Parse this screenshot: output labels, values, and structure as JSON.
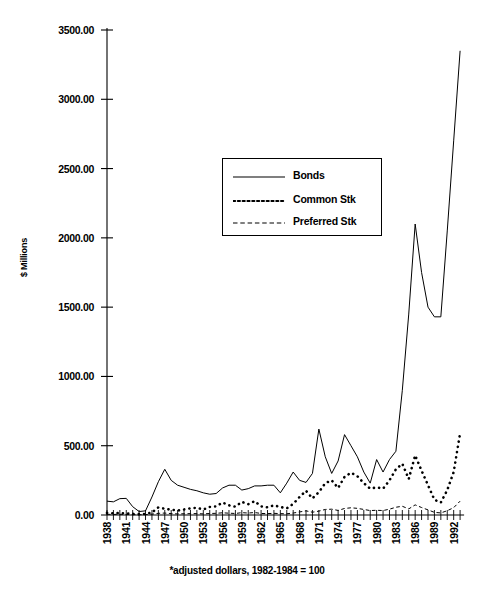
{
  "chart_data": {
    "type": "line",
    "title": "",
    "xlabel": "",
    "ylabel": "$ Millions",
    "footnote": "*adjusted dollars, 1982-1984 = 100",
    "ylim": [
      0,
      3500
    ],
    "ytick_labels": [
      "3500.00",
      "3000.00",
      "2500.00",
      "2000.00",
      "1500.00",
      "1000.00",
      "500.00",
      "0.00"
    ],
    "ytick_values": [
      3500,
      3000,
      2500,
      2000,
      1500,
      1000,
      500,
      0
    ],
    "xlim": [
      1938,
      1993
    ],
    "xtick_labels": [
      "1938",
      "1941",
      "1944",
      "1947",
      "1950",
      "1953",
      "1956",
      "1959",
      "1962",
      "1965",
      "1968",
      "1971",
      "1974",
      "1977",
      "1980",
      "1983",
      "1986",
      "1989",
      "1992"
    ],
    "x": [
      1938,
      1939,
      1940,
      1941,
      1942,
      1943,
      1944,
      1945,
      1946,
      1947,
      1948,
      1949,
      1950,
      1951,
      1952,
      1953,
      1954,
      1955,
      1956,
      1957,
      1958,
      1959,
      1960,
      1961,
      1962,
      1963,
      1964,
      1965,
      1966,
      1967,
      1968,
      1969,
      1970,
      1971,
      1972,
      1973,
      1974,
      1975,
      1976,
      1977,
      1978,
      1979,
      1980,
      1981,
      1982,
      1983,
      1984,
      1985,
      1986,
      1987,
      1988,
      1989,
      1990,
      1991,
      1992,
      1993
    ],
    "grid": false,
    "legend_position": "upper-center",
    "series": [
      {
        "name": "Bonds",
        "style": "solid",
        "color": "#000000",
        "values": [
          100,
          95,
          118,
          120,
          60,
          25,
          30,
          130,
          240,
          330,
          250,
          215,
          200,
          185,
          175,
          160,
          150,
          155,
          195,
          215,
          215,
          180,
          190,
          210,
          210,
          215,
          215,
          160,
          230,
          310,
          250,
          235,
          300,
          620,
          420,
          300,
          390,
          580,
          500,
          420,
          310,
          230,
          400,
          310,
          400,
          460,
          900,
          1450,
          2100,
          1750,
          1500,
          1430,
          1430,
          2050,
          2700,
          3350
        ]
      },
      {
        "name": "Common Stk",
        "style": "dotted",
        "color": "#000000",
        "values": [
          15,
          12,
          14,
          12,
          8,
          6,
          8,
          18,
          55,
          45,
          38,
          32,
          40,
          48,
          52,
          40,
          58,
          62,
          90,
          70,
          60,
          95,
          78,
          100,
          62,
          55,
          70,
          58,
          48,
          80,
          130,
          175,
          120,
          165,
          230,
          250,
          195,
          275,
          305,
          280,
          230,
          190,
          200,
          190,
          250,
          330,
          370,
          260,
          430,
          320,
          215,
          110,
          90,
          180,
          310,
          590
        ]
      },
      {
        "name": "Preferred Stk",
        "style": "dashed",
        "color": "#000000",
        "values": [
          5,
          4,
          5,
          4,
          3,
          2,
          3,
          6,
          12,
          14,
          10,
          8,
          9,
          10,
          10,
          8,
          11,
          12,
          16,
          13,
          11,
          17,
          14,
          18,
          11,
          10,
          12,
          10,
          9,
          14,
          22,
          30,
          20,
          28,
          40,
          42,
          33,
          47,
          52,
          48,
          40,
          32,
          34,
          32,
          42,
          56,
          63,
          44,
          73,
          54,
          37,
          19,
          15,
          31,
          53,
          100
        ]
      }
    ]
  },
  "legend": {
    "items": [
      {
        "label": "Bonds",
        "style": "solid"
      },
      {
        "label": "Common Stk",
        "style": "dotted"
      },
      {
        "label": "Preferred Stk",
        "style": "dashed"
      }
    ]
  }
}
